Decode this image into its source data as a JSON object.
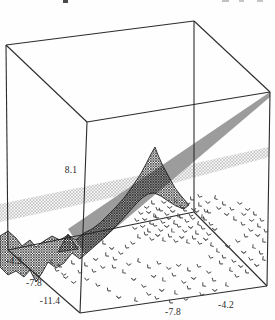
{
  "figure": {
    "kind": "3d-perspective-plot",
    "top_fragments": [
      {
        "x": 63,
        "y": 0,
        "w": 5,
        "h": 3,
        "color": "#4a4a4a"
      },
      {
        "x": 222,
        "y": 0,
        "w": 7,
        "h": 2,
        "color": "#c2c2c2"
      },
      {
        "x": 239,
        "y": 0,
        "w": 5,
        "h": 2,
        "color": "#c6c6c6"
      },
      {
        "x": 257,
        "y": 0,
        "w": 6,
        "h": 2,
        "color": "#c6c6c6"
      }
    ]
  },
  "axes": {
    "z_tick": "8.1",
    "y_ticks": [
      "-4.2",
      "-7.8",
      "-11.4"
    ],
    "x_ticks": [
      "-7.8",
      "-4.2"
    ]
  },
  "chart_data": {
    "type": "scatter",
    "subtype": "3d-box-with-surfaces",
    "title": "",
    "z_axis_ticks": [
      "8.1"
    ],
    "y_axis_ticks": [
      "-4.2",
      "-7.8",
      "-11.4"
    ],
    "x_axis_ticks": [
      "-7.8",
      "-4.2"
    ],
    "colors": {
      "frame": "#2c2c2c",
      "plane_gray": "#9c9c9c",
      "dark_mesh_line": "#1b1b1b",
      "light_mesh_line": "#8f8f8f",
      "marker": "#3f3f3f"
    },
    "box_corners": {
      "back_top_left": [
        6,
        45
      ],
      "back_top_apex": [
        194,
        21
      ],
      "right_top": [
        270,
        92
      ],
      "right_bottom": [
        267,
        286
      ],
      "front_bottom": [
        80,
        313
      ],
      "left_bottom": [
        8,
        250
      ],
      "front_top": [
        87,
        122
      ],
      "back_bottom": [
        194,
        212
      ]
    },
    "box_edges": [
      [
        6,
        45,
        194,
        21
      ],
      [
        194,
        21,
        270,
        92
      ],
      [
        270,
        92,
        267,
        286
      ],
      [
        267,
        286,
        80,
        313
      ],
      [
        80,
        313,
        8,
        250
      ],
      [
        8,
        250,
        6,
        45
      ],
      [
        6,
        45,
        87,
        122
      ],
      [
        87,
        122,
        270,
        92
      ],
      [
        87,
        122,
        80,
        313
      ],
      [
        194,
        21,
        194,
        212
      ],
      [
        194,
        212,
        8,
        250
      ],
      [
        194,
        212,
        267,
        286
      ]
    ],
    "gray_plane": [
      [
        270,
        92
      ],
      [
        68,
        229
      ],
      [
        85,
        254
      ],
      [
        270,
        97
      ]
    ],
    "light_mesh_plane": [
      [
        0,
        204
      ],
      [
        160,
        171
      ],
      [
        269,
        147
      ],
      [
        269,
        157
      ],
      [
        160,
        187
      ],
      [
        0,
        222
      ]
    ],
    "dark_surface": [
      [
        0,
        236
      ],
      [
        8,
        231
      ],
      [
        16,
        238
      ],
      [
        22,
        246
      ],
      [
        30,
        240
      ],
      [
        36,
        247
      ],
      [
        44,
        241
      ],
      [
        52,
        236
      ],
      [
        60,
        240
      ],
      [
        68,
        235
      ],
      [
        76,
        240
      ],
      [
        84,
        233
      ],
      [
        92,
        229
      ],
      [
        100,
        223
      ],
      [
        108,
        215
      ],
      [
        116,
        207
      ],
      [
        124,
        198
      ],
      [
        132,
        187
      ],
      [
        140,
        175
      ],
      [
        146,
        164
      ],
      [
        151,
        154
      ],
      [
        155,
        147
      ],
      [
        158,
        155
      ],
      [
        163,
        166
      ],
      [
        169,
        177
      ],
      [
        175,
        188
      ],
      [
        182,
        197
      ],
      [
        189,
        205
      ],
      [
        184,
        209
      ],
      [
        176,
        206
      ],
      [
        168,
        201
      ],
      [
        161,
        196
      ],
      [
        154,
        193
      ],
      [
        148,
        194
      ],
      [
        142,
        198
      ],
      [
        136,
        204
      ],
      [
        128,
        213
      ],
      [
        120,
        222
      ],
      [
        112,
        230
      ],
      [
        104,
        238
      ],
      [
        96,
        245
      ],
      [
        88,
        252
      ],
      [
        80,
        259
      ],
      [
        72,
        253
      ],
      [
        64,
        263
      ],
      [
        56,
        268
      ],
      [
        48,
        262
      ],
      [
        42,
        273
      ],
      [
        36,
        282
      ],
      [
        30,
        270
      ],
      [
        24,
        277
      ],
      [
        16,
        271
      ],
      [
        8,
        275
      ],
      [
        0,
        267
      ]
    ],
    "dark_fin": [
      [
        58,
        252
      ],
      [
        68,
        234
      ],
      [
        78,
        249
      ]
    ],
    "scatter_points_screen": [
      [
        147,
        207
      ],
      [
        153,
        203
      ],
      [
        158,
        209
      ],
      [
        164,
        202
      ],
      [
        170,
        207
      ],
      [
        176,
        201
      ],
      [
        182,
        207
      ],
      [
        188,
        203
      ],
      [
        194,
        209
      ],
      [
        200,
        205
      ],
      [
        206,
        211
      ],
      [
        141,
        213
      ],
      [
        149,
        212
      ],
      [
        155,
        216
      ],
      [
        161,
        210
      ],
      [
        167,
        214
      ],
      [
        173,
        211
      ],
      [
        179,
        216
      ],
      [
        185,
        210
      ],
      [
        191,
        215
      ],
      [
        197,
        211
      ],
      [
        203,
        217
      ],
      [
        209,
        212
      ],
      [
        137,
        220
      ],
      [
        145,
        219
      ],
      [
        151,
        223
      ],
      [
        157,
        217
      ],
      [
        163,
        222
      ],
      [
        169,
        218
      ],
      [
        175,
        223
      ],
      [
        181,
        217
      ],
      [
        187,
        221
      ],
      [
        193,
        218
      ],
      [
        199,
        224
      ],
      [
        205,
        219
      ],
      [
        211,
        224
      ],
      [
        135,
        228
      ],
      [
        143,
        226
      ],
      [
        149,
        231
      ],
      [
        155,
        225
      ],
      [
        161,
        230
      ],
      [
        167,
        226
      ],
      [
        173,
        231
      ],
      [
        179,
        226
      ],
      [
        185,
        231
      ],
      [
        191,
        227
      ],
      [
        197,
        233
      ],
      [
        203,
        228
      ],
      [
        209,
        234
      ],
      [
        215,
        229
      ],
      [
        139,
        237
      ],
      [
        146,
        234
      ],
      [
        152,
        239
      ],
      [
        158,
        235
      ],
      [
        164,
        240
      ],
      [
        170,
        236
      ],
      [
        176,
        241
      ],
      [
        182,
        237
      ],
      [
        188,
        242
      ],
      [
        194,
        238
      ],
      [
        200,
        243
      ],
      [
        206,
        239
      ],
      [
        212,
        245
      ],
      [
        192,
        199
      ],
      [
        200,
        196
      ],
      [
        208,
        202
      ],
      [
        216,
        198
      ],
      [
        224,
        204
      ],
      [
        232,
        209
      ],
      [
        240,
        203
      ],
      [
        248,
        209
      ],
      [
        255,
        214
      ],
      [
        262,
        220
      ],
      [
        244,
        214
      ],
      [
        252,
        220
      ],
      [
        259,
        226
      ],
      [
        266,
        231
      ],
      [
        219,
        208
      ],
      [
        227,
        214
      ],
      [
        235,
        219
      ],
      [
        243,
        224
      ],
      [
        251,
        230
      ],
      [
        258,
        235
      ],
      [
        264,
        241
      ],
      [
        246,
        236
      ],
      [
        238,
        241
      ],
      [
        228,
        246
      ],
      [
        218,
        251
      ],
      [
        224,
        257
      ],
      [
        234,
        261
      ],
      [
        244,
        252
      ],
      [
        254,
        247
      ],
      [
        261,
        253
      ],
      [
        251,
        259
      ],
      [
        241,
        266
      ],
      [
        231,
        270
      ],
      [
        221,
        263
      ],
      [
        211,
        257
      ],
      [
        257,
        265
      ],
      [
        264,
        259
      ],
      [
        247,
        272
      ],
      [
        237,
        276
      ],
      [
        129,
        264
      ],
      [
        139,
        261
      ],
      [
        149,
        267
      ],
      [
        159,
        263
      ],
      [
        169,
        268
      ],
      [
        179,
        265
      ],
      [
        189,
        270
      ],
      [
        199,
        266
      ],
      [
        209,
        272
      ],
      [
        154,
        276
      ],
      [
        164,
        280
      ],
      [
        174,
        275
      ],
      [
        184,
        282
      ],
      [
        194,
        278
      ],
      [
        204,
        285
      ],
      [
        214,
        280
      ],
      [
        144,
        286
      ],
      [
        134,
        279
      ],
      [
        124,
        272
      ],
      [
        114,
        267
      ],
      [
        149,
        294
      ],
      [
        162,
        290
      ],
      [
        176,
        293
      ],
      [
        189,
        288
      ],
      [
        202,
        294
      ],
      [
        215,
        290
      ],
      [
        227,
        285
      ],
      [
        109,
        290
      ],
      [
        98,
        285
      ],
      [
        119,
        297
      ],
      [
        136,
        300
      ],
      [
        171,
        302
      ],
      [
        157,
        298
      ],
      [
        186,
        299
      ],
      [
        52,
        262
      ],
      [
        60,
        266
      ],
      [
        57,
        270
      ],
      [
        64,
        274
      ],
      [
        66,
        277
      ],
      [
        73,
        263
      ],
      [
        80,
        272
      ],
      [
        87,
        279
      ],
      [
        74,
        282
      ],
      [
        86,
        265
      ],
      [
        94,
        271
      ],
      [
        103,
        267
      ],
      [
        96,
        259
      ],
      [
        107,
        255
      ],
      [
        115,
        259
      ],
      [
        121,
        253
      ],
      [
        112,
        248
      ],
      [
        104,
        243
      ],
      [
        127,
        247
      ],
      [
        133,
        243
      ]
    ]
  }
}
